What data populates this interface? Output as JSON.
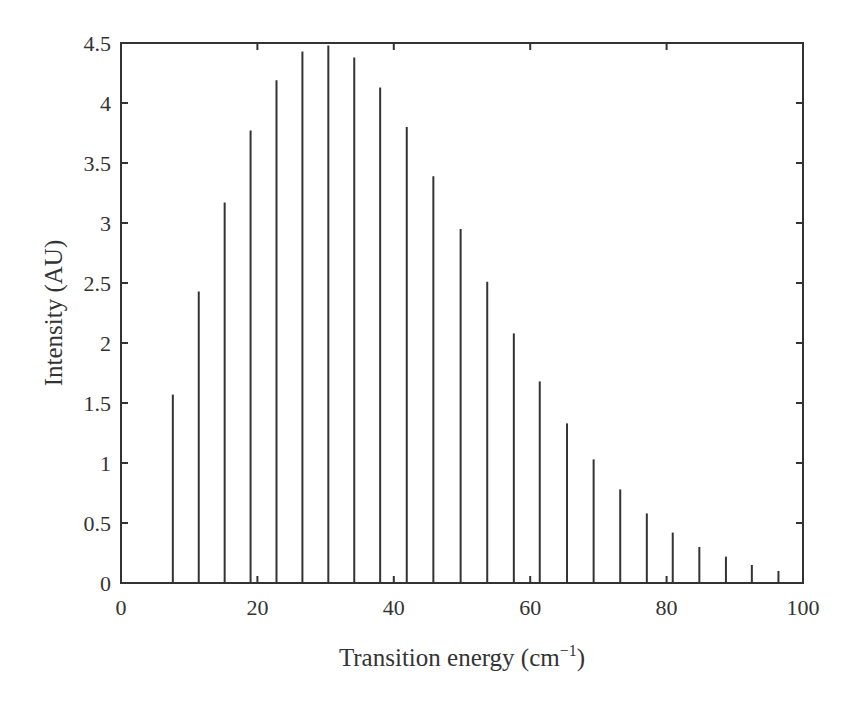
{
  "chart_data": {
    "type": "bar",
    "subtype": "stick-spectrum",
    "title": "",
    "xlabel": "Transition energy (cm⁻¹)",
    "xlabel_base": "Transition energy (cm",
    "xlabel_sup": "−1",
    "xlabel_close": ")",
    "ylabel": "Intensity (AU)",
    "xlim": [
      0,
      100
    ],
    "ylim": [
      0,
      4.5
    ],
    "xticks": [
      0,
      20,
      40,
      60,
      80,
      100
    ],
    "yticks": [
      0,
      0.5,
      1,
      1.5,
      2,
      2.5,
      3,
      3.5,
      4,
      4.5
    ],
    "ytick_labels": [
      "0",
      "0.5",
      "1",
      "1.5",
      "2",
      "2.5",
      "3",
      "3.5",
      "4",
      "4.5"
    ],
    "grid": false,
    "legend": null,
    "x": [
      7.6,
      11.4,
      15.2,
      19.0,
      22.8,
      26.6,
      30.4,
      34.2,
      38.0,
      41.9,
      45.8,
      49.8,
      53.7,
      57.6,
      61.4,
      65.4,
      69.3,
      73.2,
      77.1,
      80.9,
      84.8,
      88.7,
      92.5,
      96.4
    ],
    "values": [
      1.57,
      2.43,
      3.17,
      3.77,
      4.19,
      4.43,
      4.48,
      4.38,
      4.13,
      3.8,
      3.39,
      2.95,
      2.51,
      2.08,
      1.68,
      1.33,
      1.03,
      0.78,
      0.58,
      0.42,
      0.3,
      0.22,
      0.15,
      0.1
    ],
    "colors": {
      "stick": "#333333",
      "axes": "#333333",
      "background": "#ffffff"
    }
  }
}
